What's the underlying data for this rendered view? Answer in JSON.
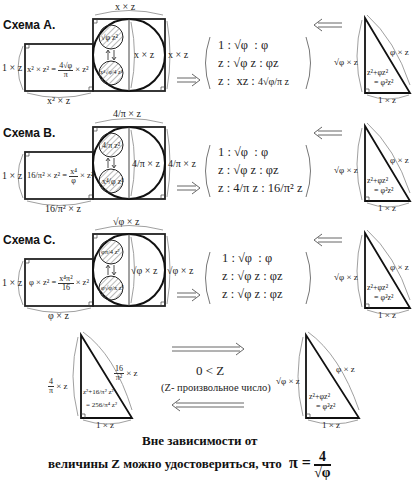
{
  "schemes": [
    {
      "label": "Схема A.",
      "top_label": "x × z",
      "right_outer_label": "x × z",
      "circle_label": "x × z",
      "left_label": "1 × z",
      "rect_formula_left": "x² × z² =",
      "rect_formula_num": "4√φ",
      "rect_formula_den": "π",
      "rect_formula_right": "× z²",
      "bottom_label": "x² × z",
      "small_circle_top": "√φ z²",
      "small_circle_bottom": "x⁴√φ/4 z²",
      "matrix_rows": [
        [
          "1",
          ":",
          "√φ",
          ":",
          "φ"
        ],
        [
          "z",
          ":",
          "√φ z",
          ":",
          "φz"
        ],
        [
          "z",
          ":",
          "xz",
          ":",
          "4√φ/π z"
        ]
      ],
      "triangle": {
        "left_label": "√φ × z",
        "hyp_label": "φ × z",
        "bottom_label": "1 × z",
        "inner_line1": "z²+φz²",
        "inner_line2": "= φ²z²"
      }
    },
    {
      "label": "Схема B.",
      "top_label": "4/π × z",
      "right_outer_label": "4/π × z",
      "circle_label": "4/π × z",
      "left_label": "1 × z",
      "rect_formula_left": "16/π² × z² =",
      "rect_formula_num": "x⁴",
      "rect_formula_den": "φ",
      "rect_formula_right": "× z²",
      "bottom_label": "16/π² × z",
      "small_circle_top": "4/π z²",
      "small_circle_bottom": "x⁴/φ z²",
      "matrix_rows": [
        [
          "1",
          ":",
          "√φ",
          ":",
          "φ"
        ],
        [
          "z",
          ":",
          "√φ z",
          ":",
          "φz"
        ],
        [
          "z",
          ":",
          "4/π z",
          ":",
          "16/π² z"
        ]
      ],
      "triangle": {
        "left_label": "√φ × z",
        "hyp_label": "φ × z",
        "bottom_label": "1 × z",
        "inner_line1": "z²+φz²",
        "inner_line2": "= φ²z²"
      }
    },
    {
      "label": "Схема C.",
      "top_label": "√φ × z",
      "right_outer_label": "√φ × z",
      "circle_label": "√φ × z",
      "left_label": "1 × z",
      "rect_formula_left": "φ × z² =",
      "rect_formula_num": "x⁴π²",
      "rect_formula_den": "16",
      "rect_formula_right": "× z²",
      "bottom_label": "φ × z",
      "small_circle_top": "φπ/4 z²",
      "small_circle_bottom": "φ√φ/x z²",
      "matrix_rows": [
        [
          "1",
          ":",
          "√φ",
          ":",
          "φ"
        ],
        [
          "z",
          ":",
          "√φ z",
          ":",
          "φz"
        ],
        [
          "z",
          ":",
          "√φ z",
          ":",
          "φz"
        ]
      ],
      "triangle": {
        "left_label": "√φ × z",
        "hyp_label": "φ × z",
        "bottom_label": "1 × z",
        "inner_line1": "z²+φz²",
        "inner_line2": "= φ²z²"
      }
    }
  ],
  "bottom_section": {
    "left_triangle": {
      "left_label_num": "4",
      "left_label_den": "π",
      "left_label_suffix": "× z",
      "hyp_label_num": "16",
      "hyp_label_den": "π²",
      "hyp_label_suffix": "× z",
      "bottom_label": "1 × z",
      "inner_line1": "z²+16/π² z²",
      "inner_line2": "= 256/π⁴ z²"
    },
    "condition": "0 < Z",
    "note": "(Z- произвольное число)",
    "right_triangle": {
      "left_label": "√φ × z",
      "hyp_label": "φ × z",
      "bottom_label": "1 × z",
      "inner_line1": "z²+φz²",
      "inner_line2": "= φ²z²"
    }
  },
  "footer": {
    "line1": "Вне зависимости от",
    "line2": "величины Z можно удостовериться, что",
    "pi_symbol": "π =",
    "pi_num": "4",
    "pi_den": "√φ"
  },
  "colors": {
    "stroke": "#222222",
    "bracket": "#888888",
    "hatch": "#666666",
    "background": "#ffffff"
  }
}
